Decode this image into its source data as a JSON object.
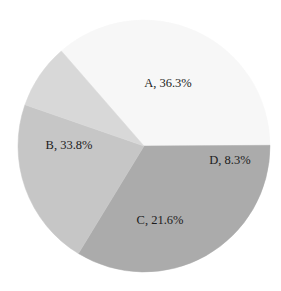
{
  "chart_data": {
    "type": "pie",
    "title": "",
    "subtitle": "",
    "xlabel": "",
    "ylabel": "",
    "grid": false,
    "legend": "none",
    "label_format": "{name}, {percent}%",
    "start_angle_deg": -41,
    "direction": "clockwise",
    "categories": [
      "A",
      "B",
      "C",
      "D"
    ],
    "values": [
      36.3,
      33.8,
      21.6,
      8.3
    ],
    "slices": [
      {
        "name": "A",
        "percent": 36.3,
        "label": "A, 36.3%",
        "color": "#f7f7f7",
        "label_x": 168,
        "label_y": 84
      },
      {
        "name": "B",
        "percent": 33.8,
        "label": "B, 33.8%",
        "color": "#ababab",
        "label_x": 69,
        "label_y": 146
      },
      {
        "name": "C",
        "percent": 21.6,
        "label": "C, 21.6%",
        "color": "#c6c6c6",
        "label_x": 160,
        "label_y": 221
      },
      {
        "name": "D",
        "percent": 8.3,
        "label": "D, 8.3%",
        "color": "#d8d8d8",
        "label_x": 230,
        "label_y": 161
      }
    ],
    "geometry": {
      "center_x": 144,
      "center_y": 146,
      "radius": 126
    },
    "background_color": "#ffffff",
    "label_color": "#1c1c1c"
  }
}
